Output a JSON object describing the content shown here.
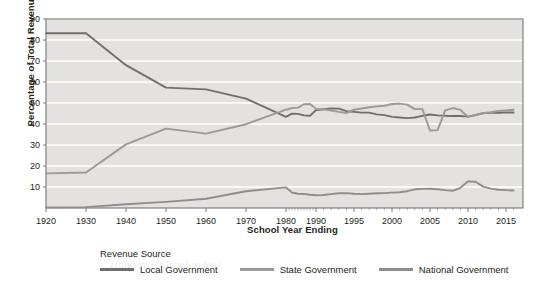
{
  "chart_data": {
    "type": "line",
    "title": "",
    "xlabel": "School Year Ending",
    "ylabel": "Percentage of Total Revenues",
    "ylim": [
      0,
      90
    ],
    "ytick_values": [
      10,
      20,
      30,
      40,
      50,
      60,
      70,
      80,
      90
    ],
    "ytick_labels": [
      "10",
      "20",
      "30",
      "40",
      "50",
      "60",
      "70",
      "80",
      "90"
    ],
    "xtick_labels": [
      "1920",
      "1930",
      "1940",
      "1950",
      "1960",
      "1970",
      "1980",
      "1990",
      "1995",
      "2000",
      "2005",
      "2010",
      "2015"
    ],
    "xtick_values": [
      1920,
      1930,
      1940,
      1950,
      1960,
      1970,
      1980,
      1990,
      1995,
      2000,
      2005,
      2010,
      2015
    ],
    "x_axis_scale": "piecewise-uniform-by-tick",
    "grid": "horizontal",
    "plot_background": "#e3e2e0",
    "legend_position": "below",
    "legend_title": "Revenue Source",
    "series": [
      {
        "name": "Local Government",
        "color": "#6f6f6f",
        "x": [
          1920,
          1930,
          1940,
          1950,
          1960,
          1970,
          1980,
          1982,
          1984,
          1986,
          1988,
          1990,
          1991,
          1992,
          1993,
          1994,
          1995,
          1996,
          1997,
          1998,
          1999,
          2000,
          2001,
          2002,
          2003,
          2004,
          2005,
          2006,
          2007,
          2008,
          2009,
          2010,
          2011,
          2012,
          2013,
          2014,
          2015,
          2016
        ],
        "values": [
          83.2,
          83.2,
          68.0,
          57.3,
          56.5,
          52.1,
          43.4,
          44.9,
          44.8,
          44.1,
          43.9,
          46.6,
          47.0,
          47.4,
          47.3,
          46.1,
          45.8,
          45.4,
          45.4,
          44.6,
          44.2,
          43.4,
          43.1,
          42.8,
          43.1,
          43.9,
          44.5,
          44.1,
          43.9,
          43.8,
          43.8,
          43.5,
          44.3,
          45.2,
          45.3,
          45.3,
          45.5,
          45.5
        ]
      },
      {
        "name": "State Government",
        "color": "#9a9a9a",
        "x": [
          1920,
          1930,
          1940,
          1950,
          1960,
          1970,
          1980,
          1982,
          1984,
          1986,
          1988,
          1990,
          1991,
          1992,
          1993,
          1994,
          1995,
          1996,
          1997,
          1998,
          1999,
          2000,
          2001,
          2002,
          2003,
          2004,
          2005,
          2006,
          2007,
          2008,
          2009,
          2010,
          2011,
          2012,
          2013,
          2014,
          2015,
          2016
        ],
        "values": [
          16.5,
          16.9,
          30.3,
          37.8,
          35.4,
          39.9,
          46.8,
          47.6,
          47.8,
          49.4,
          49.5,
          47.2,
          47.0,
          46.4,
          45.8,
          45.2,
          46.8,
          47.4,
          48.0,
          48.4,
          48.7,
          49.5,
          49.7,
          49.2,
          47.1,
          47.1,
          36.9,
          37.1,
          46.5,
          47.6,
          46.7,
          43.4,
          44.2,
          45.1,
          45.6,
          46.2,
          46.5,
          46.8
        ]
      },
      {
        "name": "National Government",
        "color": "#8e8e8e",
        "x": [
          1920,
          1930,
          1940,
          1950,
          1960,
          1970,
          1980,
          1982,
          1984,
          1986,
          1988,
          1990,
          1991,
          1992,
          1993,
          1994,
          1995,
          1996,
          1997,
          1998,
          1999,
          2000,
          2001,
          2002,
          2003,
          2004,
          2005,
          2006,
          2007,
          2008,
          2009,
          2010,
          2011,
          2012,
          2013,
          2014,
          2015,
          2016
        ],
        "values": [
          0.3,
          0.4,
          1.8,
          2.9,
          4.4,
          8.0,
          9.8,
          7.4,
          6.8,
          6.7,
          6.3,
          6.1,
          6.2,
          6.6,
          7.0,
          7.1,
          6.8,
          6.6,
          6.8,
          7.0,
          7.1,
          7.3,
          7.5,
          8.0,
          8.9,
          9.1,
          9.2,
          8.9,
          8.5,
          8.2,
          9.6,
          12.7,
          12.5,
          10.2,
          9.2,
          8.7,
          8.5,
          8.3
        ]
      }
    ]
  },
  "axes": {
    "y_title": "Percentage of Total Revenues",
    "x_title": "School Year Ending"
  },
  "legend": {
    "title": "Revenue Source",
    "items": [
      {
        "label": "Local Government",
        "color": "#6f6f6f"
      },
      {
        "label": "State Government",
        "color": "#9a9a9a"
      },
      {
        "label": "National Government",
        "color": "#8e8e8e"
      }
    ]
  },
  "bleed_text": [
    "Revenue Anomaly and Local Go",
    "of higher tax on local revenue so",
    "but the current mix of both state",
    "and the changes in revenue co",
    "some changes in the percentage",
    "School Entity and Advisory Sch",
    "new and private schools regarding how",
    "Also the expenditures of the",
    "tied to local tax receipts"
  ]
}
